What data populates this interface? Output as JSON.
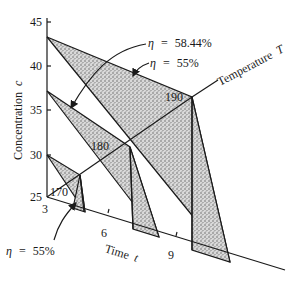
{
  "axes": {
    "vertical_label": "Concentration",
    "vertical_symbol": "c",
    "vertical_ticks": [
      "45",
      "40",
      "35",
      "30",
      "25"
    ],
    "time_label": "Time",
    "time_symbol": "t",
    "time_ticks": [
      "3",
      "6",
      "9"
    ],
    "temperature_label": "Temperature",
    "temperature_symbol": "T"
  },
  "regions": [
    {
      "temperature": "170",
      "start_concentration": 30,
      "start_time": 3
    },
    {
      "temperature": "180",
      "start_concentration": 36.5,
      "start_time": 6
    },
    {
      "temperature": "190",
      "start_concentration": 43.5,
      "start_time": 9
    }
  ],
  "annotations": [
    {
      "eta": "η",
      "eq": "=",
      "value": "58.44%"
    },
    {
      "eta": "η",
      "eq": "=",
      "value": "55%"
    },
    {
      "eta": "η",
      "eq": "=",
      "value": "55%"
    }
  ],
  "colors": {
    "ink": "#1a1a1a",
    "background": "#ffffff",
    "stipple": "#8a8a8a"
  }
}
